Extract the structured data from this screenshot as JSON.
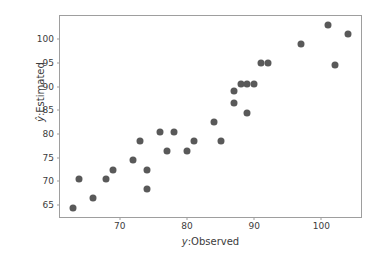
{
  "figure": {
    "background": "#ffffff"
  },
  "chart_data": {
    "type": "scatter",
    "title": "",
    "xlabel": "y:Observed",
    "ylabel": "ŷ:Estimated",
    "xlabel_var": "y",
    "xlabel_rest": ":Observed",
    "ylabel_var": "ŷ",
    "ylabel_rest": ":Estimated",
    "xlim": [
      61.1,
      105.9
    ],
    "ylim": [
      62.5,
      104.9
    ],
    "x_ticks": [
      70,
      80,
      90,
      100
    ],
    "y_ticks": [
      65,
      70,
      75,
      80,
      85,
      90,
      95,
      100
    ],
    "grid": false,
    "legend_position": "none",
    "marker_color": "#595959",
    "marker_diameter_px": 7,
    "spine_color": "#9e9e9e",
    "tick_label_color": "#3c3c3c",
    "points": [
      [
        63,
        64.5
      ],
      [
        64,
        70.5
      ],
      [
        66,
        66.5
      ],
      [
        68,
        70.5
      ],
      [
        69,
        72.5
      ],
      [
        72,
        74.5
      ],
      [
        73,
        78.5
      ],
      [
        74,
        68.5
      ],
      [
        74,
        72.5
      ],
      [
        76,
        80.5
      ],
      [
        77,
        76.5
      ],
      [
        78,
        80.5
      ],
      [
        80,
        76.5
      ],
      [
        81,
        78.5
      ],
      [
        84,
        82.5
      ],
      [
        85,
        78.5
      ],
      [
        87,
        86.5
      ],
      [
        87,
        89
      ],
      [
        88,
        90.5
      ],
      [
        89,
        84.5
      ],
      [
        89,
        90.5
      ],
      [
        90,
        90.5
      ],
      [
        91,
        95
      ],
      [
        92,
        95
      ],
      [
        97,
        99
      ],
      [
        101,
        103
      ],
      [
        102,
        94.5
      ],
      [
        104,
        101
      ]
    ]
  }
}
